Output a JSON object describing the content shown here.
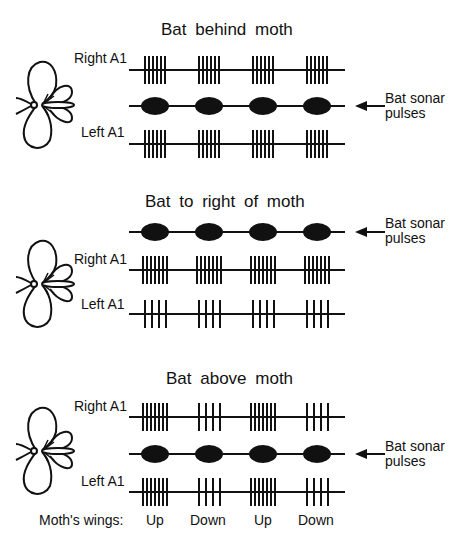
{
  "panels": [
    {
      "title": "Bat behind moth",
      "rows": [
        {
          "type": "neuron",
          "label": "Right A1",
          "spikes_per_burst": [
            6,
            6,
            6,
            6
          ]
        },
        {
          "type": "sonar",
          "label": "Bat sonar pulses",
          "label_line1": "Bat sonar",
          "label_line2": "pulses",
          "pulses": 4
        },
        {
          "type": "neuron",
          "label": "Left A1",
          "spikes_per_burst": [
            6,
            6,
            6,
            6
          ]
        }
      ]
    },
    {
      "title": "Bat to right of moth",
      "rows": [
        {
          "type": "sonar",
          "label": "Bat sonar pulses",
          "label_line1": "Bat sonar",
          "label_line2": "pulses",
          "pulses": 4
        },
        {
          "type": "neuron",
          "label": "Right A1",
          "spikes_per_burst": [
            7,
            7,
            7,
            7
          ]
        },
        {
          "type": "neuron",
          "label": "Left A1",
          "spikes_per_burst": [
            4,
            4,
            4,
            4
          ]
        }
      ]
    },
    {
      "title": "Bat above moth",
      "rows": [
        {
          "type": "neuron",
          "label": "Right A1",
          "spikes_per_burst": [
            7,
            4,
            7,
            4
          ]
        },
        {
          "type": "sonar",
          "label": "Bat sonar pulses",
          "label_line1": "Bat sonar",
          "label_line2": "pulses",
          "pulses": 4
        },
        {
          "type": "neuron",
          "label": "Left A1",
          "spikes_per_burst": [
            7,
            4,
            7,
            4
          ]
        }
      ]
    }
  ],
  "wings": {
    "label": "Moth's wings:",
    "states": [
      "Up",
      "Down",
      "Up",
      "Down"
    ]
  },
  "colors": {
    "ink": "#111111",
    "background": "#ffffff"
  }
}
